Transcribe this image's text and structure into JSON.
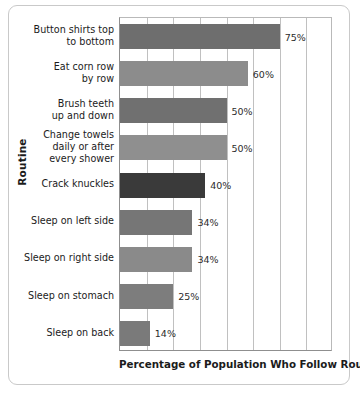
{
  "chart_data": {
    "type": "bar",
    "orientation": "horizontal",
    "title": "",
    "xlabel": "Percentage of Population Who Follow Routine",
    "ylabel": "Routine",
    "xlim": [
      0,
      100
    ],
    "xtick_interval": 12.5,
    "grid": true,
    "legend": false,
    "categories": [
      "Button shirts top to bottom",
      "Eat corn row by row",
      "Brush teeth up and down",
      "Change towels daily or after every shower",
      "Crack knuckles",
      "Sleep on left side",
      "Sleep on right side",
      "Sleep on stomach",
      "Sleep on back"
    ],
    "values": [
      75,
      60,
      50,
      50,
      40,
      34,
      34,
      25,
      14
    ],
    "value_labels": [
      "75%",
      "60%",
      "50%",
      "50%",
      "40%",
      "34%",
      "34%",
      "25%",
      "14%"
    ],
    "bars": [
      {
        "label_lines": [
          "Button shirts top",
          "to bottom"
        ],
        "value": 75,
        "value_label": "75%",
        "color": "#6e6e6e"
      },
      {
        "label_lines": [
          "Eat corn row",
          "by row"
        ],
        "value": 60,
        "value_label": "60%",
        "color": "#8c8c8c"
      },
      {
        "label_lines": [
          "Brush teeth",
          "up and down"
        ],
        "value": 50,
        "value_label": "50%",
        "color": "#707070"
      },
      {
        "label_lines": [
          "Change towels",
          "daily or after",
          "every shower"
        ],
        "value": 50,
        "value_label": "50%",
        "color": "#8f8f8f"
      },
      {
        "label_lines": [
          "Crack knuckles"
        ],
        "value": 40,
        "value_label": "40%",
        "color": "#3a3a3a"
      },
      {
        "label_lines": [
          "Sleep on left side"
        ],
        "value": 34,
        "value_label": "34%",
        "color": "#767676"
      },
      {
        "label_lines": [
          "Sleep on right side"
        ],
        "value": 34,
        "value_label": "34%",
        "color": "#8a8a8a"
      },
      {
        "label_lines": [
          "Sleep on stomach"
        ],
        "value": 25,
        "value_label": "25%",
        "color": "#7d7d7d"
      },
      {
        "label_lines": [
          "Sleep on back"
        ],
        "value": 14,
        "value_label": "14%",
        "color": "#7a7a7a"
      }
    ]
  },
  "colors": {
    "grid": "#c0c0c0",
    "axis": "#8f8f8f",
    "text": "#1b1b1b",
    "card_border": "#c9c9c9",
    "background": "#ffffff"
  }
}
